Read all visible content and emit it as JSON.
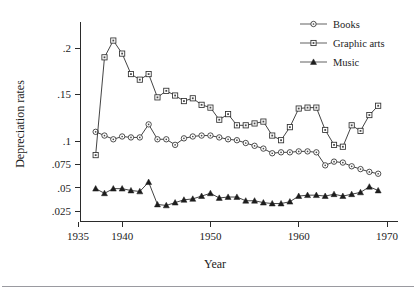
{
  "figure": {
    "background": "#ffffff",
    "line_color": "#2f2f2f",
    "axis_color": "#2b2b2b",
    "footer_rule_color": "#9a9aa0"
  },
  "axes": {
    "y_title": "Depreciation rates",
    "x_title": "Year",
    "y_ticks": [
      ".025",
      ".05",
      ".075",
      ".1",
      ".15",
      ".2"
    ],
    "x_ticks": [
      "1935",
      "1940",
      "1950",
      "1960",
      "1970"
    ]
  },
  "legend": {
    "position": "top-right",
    "entries": [
      {
        "label": "Books",
        "marker": "circle-open"
      },
      {
        "label": "Graphic arts",
        "marker": "square-open"
      },
      {
        "label": "Music",
        "marker": "triangle-filled"
      }
    ]
  },
  "chart_data": {
    "type": "line",
    "title": "",
    "xlabel": "Year",
    "ylabel": "Depreciation rates",
    "xlim": [
      1935,
      1970
    ],
    "ylim": [
      0.02,
      0.215
    ],
    "grid": false,
    "legend_position": "top-right",
    "ytick_values": [
      0.025,
      0.05,
      0.075,
      0.1,
      0.15,
      0.2
    ],
    "ytick_labels": [
      ".025",
      ".05",
      ".075",
      ".1",
      ".15",
      ".2"
    ],
    "xtick_values": [
      1935,
      1940,
      1950,
      1960,
      1970
    ],
    "xtick_labels": [
      "1935",
      "1940",
      "1950",
      "1960",
      "1970"
    ],
    "x": [
      1937,
      1938,
      1939,
      1940,
      1941,
      1942,
      1943,
      1944,
      1945,
      1946,
      1947,
      1948,
      1949,
      1950,
      1951,
      1952,
      1953,
      1954,
      1955,
      1956,
      1957,
      1958,
      1959,
      1960,
      1961,
      1962,
      1963,
      1964,
      1965,
      1966,
      1967,
      1968,
      1969
    ],
    "series": [
      {
        "name": "Books",
        "marker": "circle-open",
        "values": [
          0.11,
          0.106,
          0.102,
          0.105,
          0.104,
          0.104,
          0.118,
          0.102,
          0.102,
          0.096,
          0.103,
          0.105,
          0.106,
          0.106,
          0.104,
          0.102,
          0.101,
          0.098,
          0.095,
          0.092,
          0.087,
          0.088,
          0.088,
          0.089,
          0.089,
          0.088,
          0.074,
          0.078,
          0.077,
          0.073,
          0.07,
          0.067,
          0.065
        ]
      },
      {
        "name": "Graphic arts",
        "marker": "square-open",
        "values": [
          0.085,
          0.19,
          0.208,
          0.194,
          0.172,
          0.166,
          0.172,
          0.147,
          0.154,
          0.149,
          0.143,
          0.146,
          0.139,
          0.136,
          0.123,
          0.129,
          0.117,
          0.117,
          0.119,
          0.121,
          0.106,
          0.101,
          0.115,
          0.135,
          0.136,
          0.136,
          0.112,
          0.096,
          0.094,
          0.117,
          0.111,
          0.128,
          0.138
        ]
      },
      {
        "name": "Music",
        "marker": "triangle-filled",
        "values": [
          0.049,
          0.044,
          0.049,
          0.049,
          0.047,
          0.046,
          0.056,
          0.032,
          0.031,
          0.034,
          0.037,
          0.038,
          0.041,
          0.044,
          0.039,
          0.04,
          0.04,
          0.036,
          0.036,
          0.034,
          0.033,
          0.033,
          0.035,
          0.041,
          0.042,
          0.042,
          0.041,
          0.043,
          0.041,
          0.043,
          0.045,
          0.051,
          0.047
        ]
      }
    ]
  }
}
